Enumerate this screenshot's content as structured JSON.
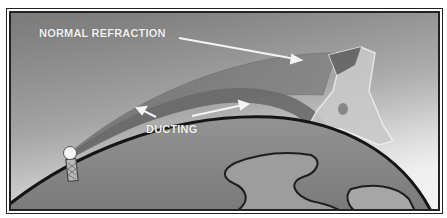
{
  "diagram": {
    "labels": {
      "normal_refraction": "NORMAL REFRACTION",
      "ducting": "DUCTING"
    },
    "elements": {
      "transmitter": "antenna-tower",
      "receiver": "jagged-terrain-target",
      "ground": "earth-curvature"
    },
    "colors": {
      "sky_top": "#7c7c7c",
      "sky_bottom": "#e2e2e2",
      "earth": "#8a8a8a",
      "land": "#9c9c9c",
      "ducting_band": "#6e6e6e",
      "refraction_beam": "#7a7a7a",
      "label": "#f2f2f2",
      "frame": "#222222"
    }
  }
}
